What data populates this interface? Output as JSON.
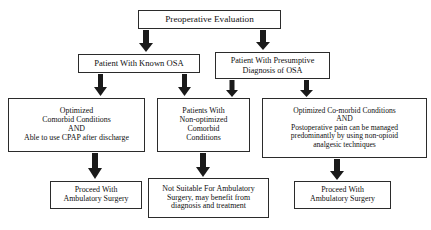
{
  "diagram": {
    "line_color": "#2b2b2b",
    "arrow_color": "#1a1a1a",
    "background": "#ffffff",
    "nodes": {
      "preoperative_evaluation": {
        "text": "Preoperative Evaluation",
        "x": 138,
        "y": 10,
        "w": 143,
        "h": 19,
        "font_size": 9.2
      },
      "known_osa": {
        "text": "Patient With Known OSA",
        "x": 78,
        "y": 54,
        "w": 122,
        "h": 19,
        "font_size": 8.6
      },
      "presumptive_osa": {
        "text": "Patient With Presumptive\nDiagnosis of OSA",
        "x": 215,
        "y": 52,
        "w": 115,
        "h": 27,
        "font_size": 8.2
      },
      "optimized_comorbid_cpap": {
        "text": "Optimized\nComorbid Conditions\nAND\nAble to use CPAP after discharge",
        "x": 8,
        "y": 98,
        "w": 137,
        "h": 54,
        "font_size": 7.9
      },
      "non_optimized_comorbid": {
        "text": "Patients With\nNon-optimized\nComorbid\nConditions",
        "x": 157,
        "y": 98,
        "w": 93,
        "h": 54,
        "font_size": 7.9
      },
      "optimized_comorbid_nonopioid": {
        "text": "Optimized Co-morbid Conditions\nAND\nPostoperative pain can be managed\npredominantly by using non-opioid\nanalgesic techniques",
        "x": 262,
        "y": 98,
        "w": 165,
        "h": 60,
        "font_size": 7.6
      },
      "proceed_left": {
        "text": "Proceed With\nAmbulatory Surgery",
        "x": 50,
        "y": 181,
        "w": 92,
        "h": 28,
        "font_size": 7.9
      },
      "not_suitable": {
        "text": "Not Suitable For Ambulatory\nSurgery, may benefit from\ndiagnosis and treatment",
        "x": 148,
        "y": 178,
        "w": 121,
        "h": 40,
        "font_size": 7.9
      },
      "proceed_right": {
        "text": "Proceed With\nAmbulatory Surgery",
        "x": 294,
        "y": 181,
        "w": 97,
        "h": 28,
        "font_size": 7.9
      }
    },
    "arrows": [
      {
        "name": "arrow-preop-to-known-osa",
        "x": 139,
        "y": 30,
        "w": 14,
        "h": 22
      },
      {
        "name": "arrow-preop-to-presumptive-osa",
        "x": 256,
        "y": 30,
        "w": 14,
        "h": 20
      },
      {
        "name": "arrow-known-osa-to-optimized",
        "x": 94,
        "y": 74,
        "w": 13,
        "h": 22
      },
      {
        "name": "arrow-known-osa-to-nonoptimized",
        "x": 178,
        "y": 74,
        "w": 13,
        "h": 22
      },
      {
        "name": "arrow-presumptive-to-nonoptimized",
        "x": 226,
        "y": 80,
        "w": 12,
        "h": 17
      },
      {
        "name": "arrow-presumptive-to-optimized-right",
        "x": 300,
        "y": 80,
        "w": 13,
        "h": 17
      },
      {
        "name": "arrow-optimized-to-proceed-left",
        "x": 88,
        "y": 153,
        "w": 14,
        "h": 26
      },
      {
        "name": "arrow-nonoptimized-to-notsuitable",
        "x": 196,
        "y": 153,
        "w": 14,
        "h": 24
      },
      {
        "name": "arrow-optimizedright-to-proceed-right",
        "x": 330,
        "y": 159,
        "w": 14,
        "h": 21
      }
    ]
  }
}
